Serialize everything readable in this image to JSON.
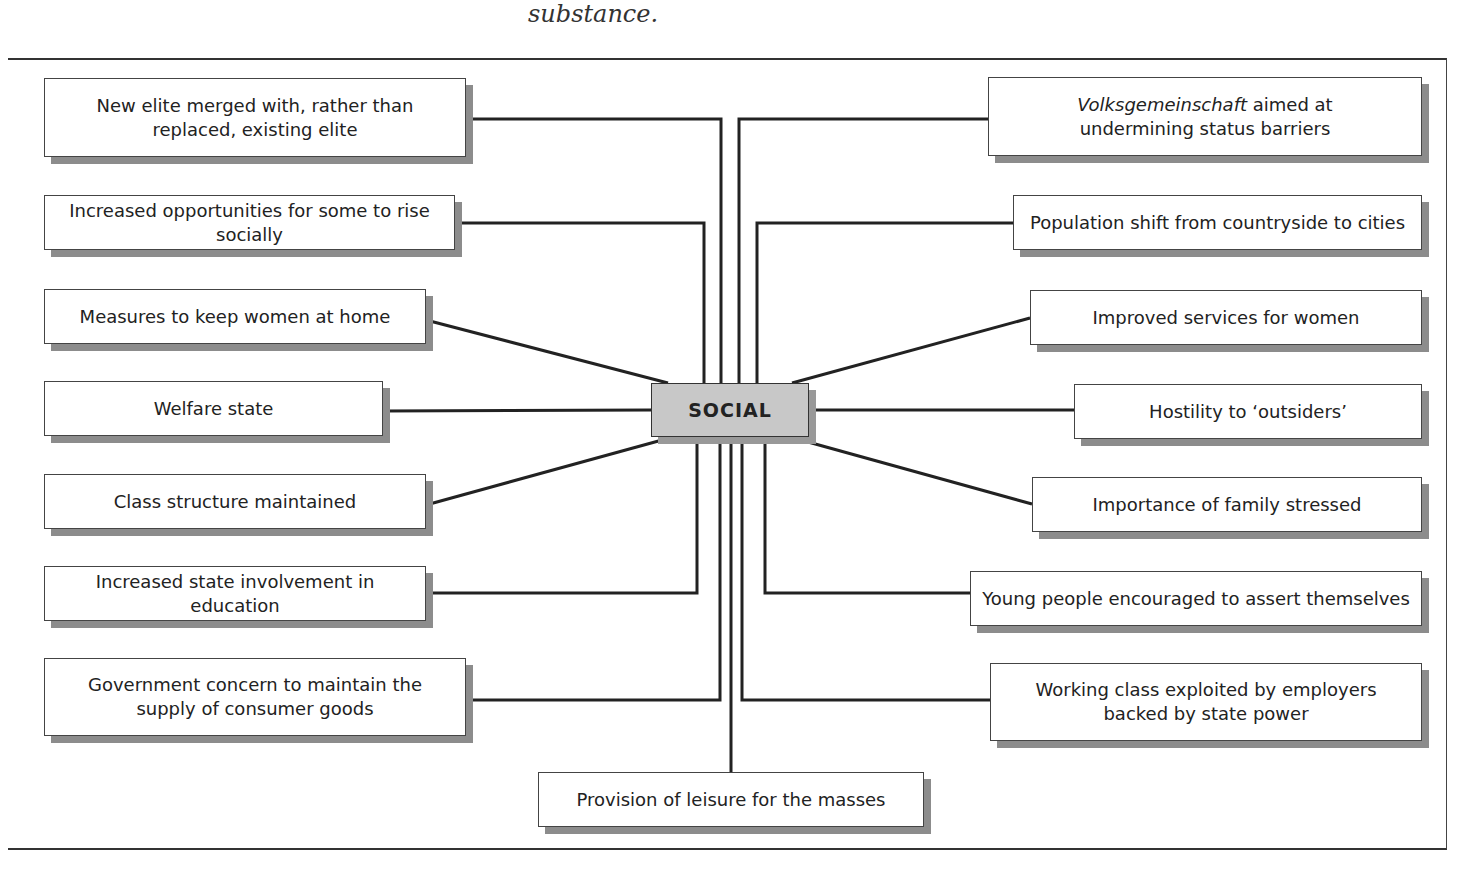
{
  "caption": "substance.",
  "center": {
    "label": "SOCIAL"
  },
  "left_nodes": [
    {
      "line1": "New elite merged with, rather than",
      "line2": "replaced, existing elite"
    },
    {
      "line1": "Increased opportunities for some to rise socially"
    },
    {
      "line1": "Measures to keep women at home"
    },
    {
      "line1": "Welfare state"
    },
    {
      "line1": "Class structure maintained"
    },
    {
      "line1": "Increased state involvement in education"
    },
    {
      "line1": "Government concern to maintain the",
      "line2": "supply of consumer goods"
    }
  ],
  "right_nodes": [
    {
      "italic": "Volksgemeinschaft",
      "line1": " aimed at",
      "line2": "undermining status barriers"
    },
    {
      "line1": "Population shift from countryside to cities"
    },
    {
      "line1": "Improved services for women"
    },
    {
      "line1": "Hostility to ‘outsiders’"
    },
    {
      "line1": "Importance of family stressed"
    },
    {
      "line1": "Young people encouraged to assert themselves"
    },
    {
      "line1": "Working class exploited by employers",
      "line2": "backed by state power"
    }
  ],
  "bottom_node": {
    "line1": "Provision of leisure for the masses"
  }
}
